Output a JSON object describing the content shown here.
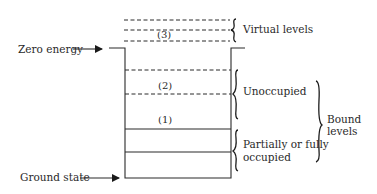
{
  "diagram": {
    "labels": {
      "zero_energy": "Zero energy",
      "ground_state": "Ground state",
      "virtual_levels": "Virtual levels",
      "unoccupied": "Unoccupied",
      "partially_line1": "Partially or fully",
      "partially_line2": "occupied",
      "bound_line1": "Bound",
      "bound_line2": "levels"
    },
    "level_markers": {
      "three": "(3)",
      "two": "(2)",
      "one": "(1)"
    },
    "levels": [
      {
        "type": "virtual",
        "style": "dashed",
        "y": 20
      },
      {
        "type": "virtual",
        "style": "dashed",
        "y": 30
      },
      {
        "type": "virtual",
        "style": "dashed",
        "y": 41,
        "marker": "(3)"
      },
      {
        "type": "unoccupied",
        "style": "dashed",
        "y": 70
      },
      {
        "type": "unoccupied",
        "style": "dashed",
        "y": 94,
        "marker": "(2)"
      },
      {
        "type": "occupied",
        "style": "solid",
        "y": 129,
        "marker": "(1)"
      },
      {
        "type": "occupied",
        "style": "solid",
        "y": 152
      },
      {
        "type": "ground",
        "style": "solid",
        "y": 178
      }
    ],
    "colors": {
      "ink": "#2a2a2a",
      "background": "#ffffff"
    }
  }
}
